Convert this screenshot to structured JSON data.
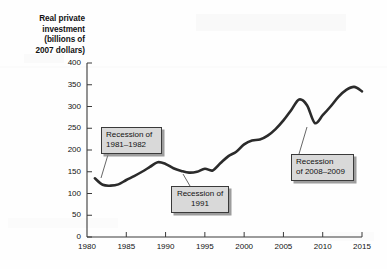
{
  "chart_data": {
    "type": "line",
    "title": "",
    "xlabel": "",
    "ylabel": "Real private investment (billions of 2007 dollars)",
    "ylabel_lines": [
      "Real private",
      "investment",
      "(billions of",
      "2007 dollars)"
    ],
    "xlim": [
      1980,
      2015
    ],
    "ylim": [
      0,
      400
    ],
    "grid": false,
    "legend": null,
    "line_color": "#2b2b2b",
    "xticks": [
      1980,
      1985,
      1990,
      1995,
      2000,
      2005,
      2010,
      2015
    ],
    "yticks": [
      0,
      50,
      100,
      150,
      200,
      250,
      300,
      350,
      400
    ],
    "x": [
      1981,
      1982,
      1983,
      1984,
      1985,
      1986,
      1987,
      1988,
      1989,
      1990,
      1991,
      1992,
      1993,
      1994,
      1995,
      1996,
      1997,
      1998,
      1999,
      2000,
      2001,
      2002,
      2003,
      2004,
      2005,
      2006,
      2007,
      2008,
      2009,
      2010,
      2011,
      2012,
      2013,
      2014,
      2015
    ],
    "values": [
      135,
      120,
      118,
      121,
      131,
      140,
      150,
      161,
      172,
      168,
      158,
      152,
      148,
      150,
      157,
      153,
      170,
      186,
      196,
      213,
      222,
      224,
      233,
      248,
      268,
      292,
      316,
      303,
      262,
      280,
      300,
      322,
      338,
      345,
      335
    ],
    "series": [
      {
        "name": "Real private investment",
        "values": [
          135,
          120,
          118,
          121,
          131,
          140,
          150,
          161,
          172,
          168,
          158,
          152,
          148,
          150,
          157,
          153,
          170,
          186,
          196,
          213,
          222,
          224,
          233,
          248,
          268,
          292,
          316,
          303,
          262,
          280,
          300,
          322,
          338,
          345,
          335
        ]
      }
    ],
    "annotations": [
      {
        "id": "1981",
        "text": "Recession of\n1981–1982",
        "points_to_x": 1983,
        "points_to_y": 118
      },
      {
        "id": "1991",
        "text": "Recession of\n1991",
        "points_to_x": 1993,
        "points_to_y": 148
      },
      {
        "id": "2008",
        "text": "Recession\nof 2008–2009",
        "points_to_x": 2009,
        "points_to_y": 262
      }
    ]
  }
}
